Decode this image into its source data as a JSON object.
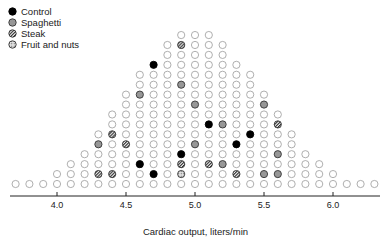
{
  "chart_data": {
    "type": "scatter",
    "subtype": "dot-histogram",
    "title": "",
    "xlabel": "Cardiac output, liters/min",
    "ylabel": "",
    "xlim": [
      3.7,
      6.3
    ],
    "x_ticks": [
      4.0,
      4.5,
      5.0,
      5.5,
      6.0
    ],
    "x_tick_labels": [
      "4.0",
      "4.5",
      "5.0",
      "5.5",
      "6.0"
    ],
    "grid": false,
    "legend_position": "top-left",
    "legend": [
      {
        "key": "control",
        "label": "Control"
      },
      {
        "key": "spaghetti",
        "label": "Spaghetti"
      },
      {
        "key": "steak",
        "label": "Steak"
      },
      {
        "key": "fruit",
        "label": "Fruit and nuts"
      }
    ],
    "columns": [
      {
        "x": 3.7,
        "count": 1
      },
      {
        "x": 3.8,
        "count": 1
      },
      {
        "x": 3.9,
        "count": 1
      },
      {
        "x": 4.0,
        "count": 2
      },
      {
        "x": 4.1,
        "count": 3
      },
      {
        "x": 4.2,
        "count": 4
      },
      {
        "x": 4.3,
        "count": 6
      },
      {
        "x": 4.4,
        "count": 8
      },
      {
        "x": 4.5,
        "count": 10
      },
      {
        "x": 4.6,
        "count": 12
      },
      {
        "x": 4.7,
        "count": 13
      },
      {
        "x": 4.8,
        "count": 15
      },
      {
        "x": 4.9,
        "count": 16
      },
      {
        "x": 5.0,
        "count": 16
      },
      {
        "x": 5.1,
        "count": 16
      },
      {
        "x": 5.2,
        "count": 15
      },
      {
        "x": 5.3,
        "count": 13
      },
      {
        "x": 5.4,
        "count": 12
      },
      {
        "x": 5.5,
        "count": 10
      },
      {
        "x": 5.6,
        "count": 8
      },
      {
        "x": 5.7,
        "count": 6
      },
      {
        "x": 5.8,
        "count": 4
      },
      {
        "x": 5.9,
        "count": 3
      },
      {
        "x": 6.0,
        "count": 2
      },
      {
        "x": 6.1,
        "count": 1
      },
      {
        "x": 6.2,
        "count": 1
      },
      {
        "x": 6.3,
        "count": 1
      }
    ],
    "highlighted_points": [
      {
        "x": 4.3,
        "row": 4,
        "group": "spaghetti"
      },
      {
        "x": 4.3,
        "row": 1,
        "group": "steak"
      },
      {
        "x": 4.4,
        "row": 5,
        "group": "steak"
      },
      {
        "x": 4.4,
        "row": 1,
        "group": "steak"
      },
      {
        "x": 4.5,
        "row": 4,
        "group": "steak"
      },
      {
        "x": 4.6,
        "row": 9,
        "group": "spaghetti"
      },
      {
        "x": 4.6,
        "row": 2,
        "group": "control"
      },
      {
        "x": 4.7,
        "row": 12,
        "group": "control"
      },
      {
        "x": 4.7,
        "row": 1,
        "group": "control"
      },
      {
        "x": 4.9,
        "row": 14,
        "group": "steak"
      },
      {
        "x": 4.9,
        "row": 10,
        "group": "spaghetti"
      },
      {
        "x": 4.9,
        "row": 3,
        "group": "control"
      },
      {
        "x": 4.9,
        "row": 2,
        "group": "steak"
      },
      {
        "x": 4.9,
        "row": 1,
        "group": "fruit"
      },
      {
        "x": 5.0,
        "row": 8,
        "group": "spaghetti"
      },
      {
        "x": 5.0,
        "row": 4,
        "group": "spaghetti"
      },
      {
        "x": 5.1,
        "row": 6,
        "group": "control"
      },
      {
        "x": 5.1,
        "row": 2,
        "group": "steak"
      },
      {
        "x": 5.2,
        "row": 6,
        "group": "spaghetti"
      },
      {
        "x": 5.2,
        "row": 2,
        "group": "spaghetti"
      },
      {
        "x": 5.3,
        "row": 4,
        "group": "control"
      },
      {
        "x": 5.3,
        "row": 1,
        "group": "steak"
      },
      {
        "x": 5.4,
        "row": 5,
        "group": "control"
      },
      {
        "x": 5.5,
        "row": 8,
        "group": "spaghetti"
      },
      {
        "x": 5.5,
        "row": 1,
        "group": "spaghetti"
      },
      {
        "x": 5.6,
        "row": 6,
        "group": "steak"
      },
      {
        "x": 5.6,
        "row": 3,
        "group": "spaghetti"
      },
      {
        "x": 5.6,
        "row": 1,
        "group": "spaghetti"
      }
    ],
    "other_points_style": "open circle"
  },
  "colors": {
    "open": "#9a9a9a",
    "control": "#000000",
    "spaghetti": "#555555",
    "steak": "#444444",
    "fruit": "#777777",
    "axis": "#222222"
  }
}
